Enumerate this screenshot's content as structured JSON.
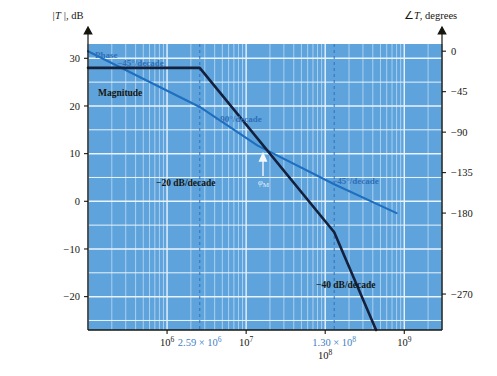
{
  "figure": {
    "kind": "bode-plot",
    "background": "#ffffff",
    "plot_fill": "#5fa3dd",
    "grid_color": "#cfe4f5",
    "magnitude_color": "#14213d",
    "phase_color": "#1f6fc0",
    "dashed_marker_color": "#2f6fb8"
  },
  "axes": {
    "left_title": "|T |, dB",
    "right_title": "∠T, degrees",
    "left_ticks": [
      {
        "label": "30",
        "value": 30
      },
      {
        "label": "20",
        "value": 20
      },
      {
        "label": "10",
        "value": 10
      },
      {
        "label": "0",
        "value": 0
      },
      {
        "label": "−10",
        "value": -10
      },
      {
        "label": "−20",
        "value": -20
      }
    ],
    "right_ticks": [
      {
        "label": "0",
        "value": 0
      },
      {
        "label": "−45",
        "value": -45
      },
      {
        "label": "−90",
        "value": -90
      },
      {
        "label": "−135",
        "value": -135
      },
      {
        "label": "−180",
        "value": -180
      },
      {
        "label": "−270",
        "value": -270
      }
    ],
    "x_ticks": [
      {
        "mantissa": "10",
        "exponent": "6",
        "blue": false
      },
      {
        "mantissa": "2.59 × 10",
        "exponent": "6",
        "blue": true
      },
      {
        "mantissa": "10",
        "exponent": "7",
        "blue": false
      },
      {
        "mantissa": "1.30 × 10",
        "exponent": "8",
        "blue": true
      },
      {
        "mantissa": "10",
        "exponent": "8",
        "blue": false
      },
      {
        "mantissa": "10",
        "exponent": "9",
        "blue": false
      }
    ]
  },
  "annotations": {
    "magnitude_label": "Magnitude",
    "phase_label": "Phase",
    "slope_mag_1": "−20 dB/decade",
    "slope_mag_2": "−40 dB/decade",
    "slope_phase_1": "−45°/decade",
    "slope_phase_2": "−90°/decade",
    "slope_phase_3": "−45°/decade",
    "phase_margin": "φ",
    "phase_margin_sub": "M"
  },
  "chart_data": {
    "type": "line",
    "title": "",
    "xlabel": "",
    "ylabel": "|T |, dB",
    "xscale": "log",
    "xlim": [
      100000,
      3000000000
    ],
    "ylim_left": [
      -27,
      33
    ],
    "ylim_right": [
      -310,
      8
    ],
    "grid": true,
    "legend": "inline-annotations",
    "series": [
      {
        "name": "Magnitude",
        "axis": "left",
        "units": "dB",
        "color": "#14213d",
        "breakpoints": [
          {
            "f": 100000,
            "mag_db": 28
          },
          {
            "f": 2590000,
            "mag_db": 28
          },
          {
            "f": 130000000,
            "mag_db": -6.5
          },
          {
            "f": 440000000,
            "mag_db": -27
          }
        ],
        "slopes_db_per_decade": [
          0,
          -20,
          -40
        ]
      },
      {
        "name": "Phase",
        "axis": "right",
        "units": "degrees",
        "color": "#1f6fc0",
        "breakpoints": [
          {
            "f": 100000,
            "phase_deg": 0
          },
          {
            "f": 2590000,
            "phase_deg": -62
          },
          {
            "f": 14000000,
            "phase_deg": -105
          },
          {
            "f": 130000000,
            "phase_deg": -148
          },
          {
            "f": 800000000,
            "phase_deg": -180
          }
        ],
        "slopes_deg_per_decade": [
          -45,
          -90,
          -45
        ]
      }
    ],
    "markers": [
      {
        "label": "2.59 × 10⁶",
        "f": 2590000,
        "style": "dashed-vertical"
      },
      {
        "label": "1.30 × 10⁸",
        "f": 130000000,
        "style": "dashed-vertical"
      }
    ],
    "callouts": [
      {
        "text": "−20 dB/decade",
        "series": "Magnitude"
      },
      {
        "text": "−40 dB/decade",
        "series": "Magnitude"
      },
      {
        "text": "−45°/decade",
        "series": "Phase"
      },
      {
        "text": "−90°/decade",
        "series": "Phase"
      },
      {
        "text": "−45°/decade",
        "series": "Phase"
      },
      {
        "text": "φM",
        "series": "Phase",
        "meaning": "phase margin"
      }
    ]
  }
}
